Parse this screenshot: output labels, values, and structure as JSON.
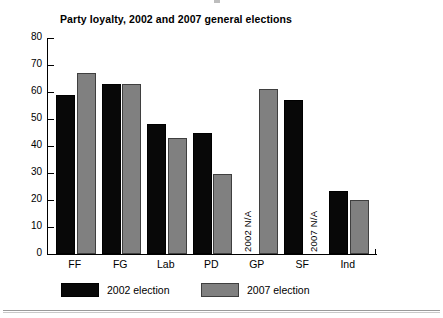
{
  "chart_data": {
    "type": "bar",
    "title": "Party loyalty, 2002 and 2007 general elections",
    "xlabel": "",
    "ylabel": "",
    "ylim": [
      0,
      80
    ],
    "yticks": [
      0,
      10,
      20,
      30,
      40,
      50,
      60,
      70,
      80
    ],
    "grid": false,
    "legend_position": "bottom-left",
    "categories": [
      "FF",
      "FG",
      "Lab",
      "PD",
      "GP",
      "SF",
      "Ind"
    ],
    "series": [
      {
        "name": "2002 election",
        "color": "#080808",
        "values": [
          59,
          63,
          48,
          45,
          null,
          57,
          23.5
        ]
      },
      {
        "name": "2007 election",
        "color": "#808080",
        "values": [
          67,
          63,
          43,
          29.5,
          61,
          null,
          20
        ]
      }
    ],
    "annotations": [
      {
        "text": "2002 N/A",
        "category": "GP",
        "series": "2002 election",
        "rotation": 90
      },
      {
        "text": "2007 N/A",
        "category": "SF",
        "series": "2007 election",
        "rotation": 90
      }
    ]
  },
  "legend": {
    "items": [
      {
        "label": "2002 election",
        "swatch": "#080808"
      },
      {
        "label": "2007 election",
        "swatch": "#808080"
      }
    ]
  }
}
